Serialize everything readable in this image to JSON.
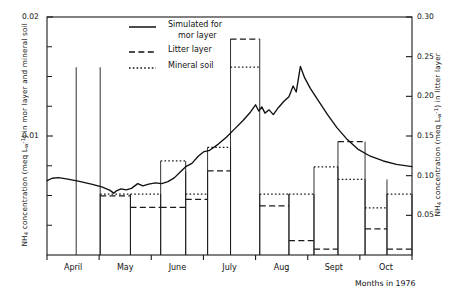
{
  "figure": {
    "months_caption": "Months in 1976"
  },
  "axes": {
    "left": {
      "label_prefix": "NH",
      "label_sub": "4",
      "label_mid": " concentration (meq L",
      "label_sup": "-1",
      "label_suffix": ") in mor layer and mineral soil",
      "label_full": "NH4 concentration (meq Lw-1) in mor layer and mineral soil",
      "ticks": [
        {
          "value": 0.02,
          "label": "0.02"
        },
        {
          "value": 0.01,
          "label": "0.01"
        }
      ],
      "minor_ticks": [
        0.0025,
        0.005,
        0.0075,
        0.0125,
        0.015,
        0.0175
      ],
      "range": [
        0.0,
        0.02
      ]
    },
    "right": {
      "label_prefix": "NH",
      "label_sub": "4",
      "label_mid": " concentration (meq L",
      "label_sup": "-1",
      "label_suffix": ") in litter layer",
      "label_full": "NH4 concentration (meq Lw-1) in litter layer",
      "ticks": [
        {
          "value": 0.3,
          "label": "0.30"
        },
        {
          "value": 0.25,
          "label": "0.25"
        },
        {
          "value": 0.2,
          "label": "0.20"
        },
        {
          "value": 0.15,
          "label": "0.15"
        },
        {
          "value": 0.1,
          "label": "0.10"
        },
        {
          "value": 0.05,
          "label": "0.05"
        }
      ],
      "range": [
        0.0,
        0.3
      ]
    },
    "x": {
      "months": [
        "April",
        "May",
        "June",
        "July",
        "Aug",
        "Sept",
        "Oct"
      ],
      "caption": "Months in 1976"
    }
  },
  "legend": {
    "items": [
      {
        "style": "solid",
        "label_line1": "Simulated for",
        "label_line2": "mor layer"
      },
      {
        "style": "dashed",
        "label_line1": "Litter layer",
        "label_line2": ""
      },
      {
        "style": "dotted",
        "label_line1": "Mineral soil",
        "label_line2": ""
      }
    ]
  },
  "chart_data": {
    "type": "line",
    "title": "",
    "subtitle": "",
    "xlabel": "Months in 1976",
    "ylabel": "NH4 concentration (meq L-1) in mor layer and mineral soil",
    "ylabel_right": "NH4 concentration (meq L-1) in litter layer",
    "xlim": [
      0,
      7
    ],
    "ylim": [
      0,
      0.02
    ],
    "ylim_right": [
      0,
      0.3
    ],
    "grid": false,
    "legend_position": "top-center",
    "x_tick_labels": [
      "April",
      "May",
      "June",
      "July",
      "Aug",
      "Sept",
      "Oct"
    ],
    "y_tick_labels_left": [
      "0.01",
      "0.02"
    ],
    "y_tick_labels_right": [
      "0.05",
      "0.10",
      "0.15",
      "0.20",
      "0.25",
      "0.30"
    ],
    "series": [
      {
        "name": "Simulated for mor layer",
        "style": "solid",
        "axis": "left",
        "units": "meq L-1",
        "points": [
          {
            "x": 0.0,
            "y": 0.00625
          },
          {
            "x": 0.1,
            "y": 0.00645
          },
          {
            "x": 0.22,
            "y": 0.0065
          },
          {
            "x": 0.4,
            "y": 0.00638
          },
          {
            "x": 0.62,
            "y": 0.00618
          },
          {
            "x": 0.85,
            "y": 0.00596
          },
          {
            "x": 1.05,
            "y": 0.00572
          },
          {
            "x": 1.2,
            "y": 0.00545
          },
          {
            "x": 1.28,
            "y": 0.0052
          },
          {
            "x": 1.33,
            "y": 0.00538
          },
          {
            "x": 1.42,
            "y": 0.00556
          },
          {
            "x": 1.52,
            "y": 0.00548
          },
          {
            "x": 1.62,
            "y": 0.0056
          },
          {
            "x": 1.74,
            "y": 0.006
          },
          {
            "x": 1.84,
            "y": 0.0058
          },
          {
            "x": 1.95,
            "y": 0.00596
          },
          {
            "x": 2.08,
            "y": 0.00606
          },
          {
            "x": 2.2,
            "y": 0.006
          },
          {
            "x": 2.32,
            "y": 0.00616
          },
          {
            "x": 2.44,
            "y": 0.00648
          },
          {
            "x": 2.56,
            "y": 0.007
          },
          {
            "x": 2.66,
            "y": 0.00742
          },
          {
            "x": 2.78,
            "y": 0.0077
          },
          {
            "x": 2.9,
            "y": 0.0083
          },
          {
            "x": 3.0,
            "y": 0.00866
          },
          {
            "x": 3.12,
            "y": 0.0088
          },
          {
            "x": 3.28,
            "y": 0.0093
          },
          {
            "x": 3.44,
            "y": 0.0099
          },
          {
            "x": 3.6,
            "y": 0.0106
          },
          {
            "x": 3.76,
            "y": 0.0113
          },
          {
            "x": 3.9,
            "y": 0.012
          },
          {
            "x": 4.0,
            "y": 0.01262
          },
          {
            "x": 4.06,
            "y": 0.0121
          },
          {
            "x": 4.12,
            "y": 0.01245
          },
          {
            "x": 4.18,
            "y": 0.01192
          },
          {
            "x": 4.26,
            "y": 0.0122
          },
          {
            "x": 4.34,
            "y": 0.0118
          },
          {
            "x": 4.44,
            "y": 0.0124
          },
          {
            "x": 4.54,
            "y": 0.0129
          },
          {
            "x": 4.64,
            "y": 0.0133
          },
          {
            "x": 4.72,
            "y": 0.0142
          },
          {
            "x": 4.78,
            "y": 0.0137
          },
          {
            "x": 4.86,
            "y": 0.01585
          },
          {
            "x": 4.94,
            "y": 0.0149
          },
          {
            "x": 5.05,
            "y": 0.014
          },
          {
            "x": 5.2,
            "y": 0.013
          },
          {
            "x": 5.38,
            "y": 0.0118
          },
          {
            "x": 5.56,
            "y": 0.0107
          },
          {
            "x": 5.76,
            "y": 0.0097
          },
          {
            "x": 5.96,
            "y": 0.0089
          },
          {
            "x": 6.2,
            "y": 0.0083
          },
          {
            "x": 6.45,
            "y": 0.0079
          },
          {
            "x": 6.7,
            "y": 0.00762
          },
          {
            "x": 7.0,
            "y": 0.00742
          }
        ]
      },
      {
        "name": "Litter layer",
        "style": "dashed",
        "axis": "right",
        "units": "meq L-1",
        "note": "step levels drawn across each sampling interval",
        "steps": [
          {
            "x0": 1.02,
            "x1": 1.6,
            "y": 0.0745
          },
          {
            "x0": 1.6,
            "x1": 2.18,
            "y": 0.06
          },
          {
            "x0": 2.18,
            "x1": 2.66,
            "y": 0.06
          },
          {
            "x0": 2.66,
            "x1": 3.08,
            "y": 0.07
          },
          {
            "x0": 3.08,
            "x1": 3.52,
            "y": 0.106
          },
          {
            "x0": 3.52,
            "x1": 4.08,
            "y": 0.272
          },
          {
            "x0": 4.08,
            "x1": 4.64,
            "y": 0.062
          },
          {
            "x0": 4.64,
            "x1": 5.12,
            "y": 0.018
          },
          {
            "x0": 5.12,
            "x1": 5.58,
            "y": 0.0075
          },
          {
            "x0": 5.58,
            "x1": 6.1,
            "y": 0.143
          },
          {
            "x0": 6.1,
            "x1": 6.52,
            "y": 0.033
          },
          {
            "x0": 6.52,
            "x1": 7.0,
            "y": 0.0075
          }
        ]
      },
      {
        "name": "Mineral soil",
        "style": "dotted",
        "axis": "left",
        "units": "meq L-1",
        "note": "step levels drawn across each sampling interval",
        "steps": [
          {
            "x0": 1.02,
            "x1": 1.6,
            "y": 0.00512
          },
          {
            "x0": 1.6,
            "x1": 2.18,
            "y": 0.00512
          },
          {
            "x0": 2.18,
            "x1": 2.66,
            "y": 0.0079
          },
          {
            "x0": 2.66,
            "x1": 3.08,
            "y": 0.00512
          },
          {
            "x0": 3.08,
            "x1": 3.52,
            "y": 0.00905
          },
          {
            "x0": 3.52,
            "x1": 4.08,
            "y": 0.01578
          },
          {
            "x0": 4.08,
            "x1": 4.64,
            "y": 0.00512
          },
          {
            "x0": 4.64,
            "x1": 5.12,
            "y": 0.00512
          },
          {
            "x0": 5.12,
            "x1": 5.58,
            "y": 0.0074
          },
          {
            "x0": 5.58,
            "x1": 6.1,
            "y": 0.00635
          },
          {
            "x0": 6.1,
            "x1": 6.52,
            "y": 0.00395
          },
          {
            "x0": 6.52,
            "x1": 7.0,
            "y": 0.00512
          }
        ]
      }
    ],
    "bar_outlines": [
      {
        "x0": 0.56,
        "x1": 1.02,
        "top": 0.01578,
        "note": "April-May tall outlined bar"
      },
      {
        "x0": 1.02,
        "x1": 1.6,
        "top": 0.00512
      },
      {
        "x0": 1.6,
        "x1": 2.18,
        "top": 0.00512
      },
      {
        "x0": 2.18,
        "x1": 2.66,
        "top": 0.0079
      },
      {
        "x0": 2.66,
        "x1": 3.08,
        "top": 0.007
      },
      {
        "x0": 3.08,
        "x1": 3.52,
        "top": 0.00905
      },
      {
        "x0": 3.52,
        "x1": 4.08,
        "top": 0.01815
      },
      {
        "x0": 4.08,
        "x1": 4.64,
        "top": 0.00512
      },
      {
        "x0": 4.64,
        "x1": 5.12,
        "top": 0.00512
      },
      {
        "x0": 5.12,
        "x1": 5.58,
        "top": 0.0074
      },
      {
        "x0": 5.58,
        "x1": 6.1,
        "top": 0.00953
      },
      {
        "x0": 6.1,
        "x1": 6.52,
        "top": 0.00635
      },
      {
        "x0": 6.52,
        "x1": 7.0,
        "top": 0.00512
      }
    ]
  }
}
